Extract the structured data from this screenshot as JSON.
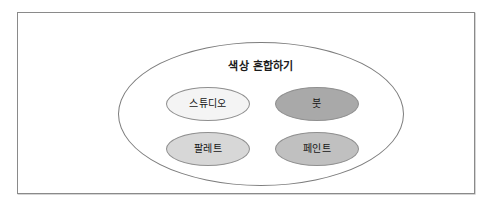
{
  "diagram": {
    "title": "색상 혼합하기",
    "type": "venn-grouping",
    "frame": {
      "border_color": "#8a8a8a",
      "background": "#ffffff"
    },
    "container": {
      "name": "색상 혼합하기",
      "shape": "ellipse",
      "border_color": "#7d7d7d",
      "fill": "none"
    },
    "nodes": [
      {
        "id": "studio",
        "label": "스튜디오",
        "shape": "ellipse",
        "fill": "#f4f4f4",
        "border_color": "#8f8f8f",
        "position": "top-left"
      },
      {
        "id": "brush",
        "label": "붓",
        "shape": "ellipse",
        "fill": "#a9a9a9",
        "border_color": "#8f8f8f",
        "position": "top-right"
      },
      {
        "id": "palette",
        "label": "팔레트",
        "shape": "ellipse",
        "fill": "#d7d7d7",
        "border_color": "#8f8f8f",
        "position": "bottom-left"
      },
      {
        "id": "paint",
        "label": "페인트",
        "shape": "ellipse",
        "fill": "#c0c0c0",
        "border_color": "#8f8f8f",
        "position": "bottom-right"
      }
    ]
  }
}
